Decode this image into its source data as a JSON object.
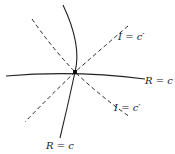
{
  "diagram": {
    "center": {
      "x": 75,
      "y": 72
    },
    "colors": {
      "stroke": "#222222",
      "background": "#ffffff"
    },
    "curves": [
      {
        "id": "R-horizontal",
        "style": "solid",
        "label": "R = c"
      },
      {
        "id": "R-vertical",
        "style": "solid",
        "label": "R = c"
      },
      {
        "id": "I-diag-1",
        "style": "dashed",
        "label": "I = c′"
      },
      {
        "id": "I-diag-2",
        "style": "dashed",
        "label": "I = c′"
      }
    ],
    "labels": {
      "i_top": "I = c′",
      "r_right": "R = c",
      "i_bottom": "I = c′",
      "r_bottom": "R = c"
    }
  }
}
